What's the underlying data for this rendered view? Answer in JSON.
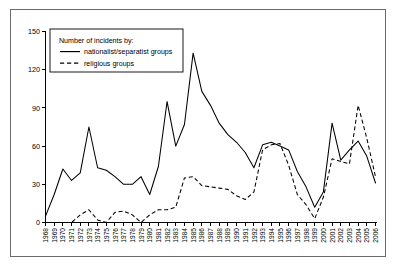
{
  "chart_data": {
    "type": "line",
    "title": "",
    "xlabel": "",
    "ylabel": "",
    "ylim": [
      0,
      150
    ],
    "yticks": [
      0,
      30,
      60,
      90,
      120,
      150
    ],
    "grid": false,
    "legend_position": "top-left",
    "legend_title": "Number of incidents by:",
    "x": [
      1968,
      1969,
      1970,
      1971,
      1972,
      1973,
      1974,
      1975,
      1976,
      1977,
      1978,
      1979,
      1980,
      1981,
      1982,
      1983,
      1984,
      1985,
      1986,
      1987,
      1988,
      1989,
      1990,
      1991,
      1992,
      1993,
      1994,
      1995,
      1996,
      1997,
      1998,
      1999,
      2000,
      2001,
      2002,
      2003,
      2004,
      2005,
      2006
    ],
    "categories": [
      "1968",
      "1969",
      "1970",
      "1971",
      "1972",
      "1973",
      "1974",
      "1975",
      "1976",
      "1977",
      "1978",
      "1979",
      "1980",
      "1981",
      "1982",
      "1983",
      "1984",
      "1985",
      "1986",
      "1987",
      "1988",
      "1989",
      "1990",
      "1991",
      "1992",
      "1993",
      "1994",
      "1995",
      "1996",
      "1997",
      "1998",
      "1999",
      "2000",
      "2001",
      "2002",
      "2003",
      "2004",
      "2005",
      "2006"
    ],
    "series": [
      {
        "name": "nationalist/separatist groups",
        "style": "solid",
        "values": [
          5,
          22,
          42,
          33,
          39,
          75,
          43,
          41,
          36,
          30,
          30,
          36,
          22,
          44,
          95,
          60,
          77,
          133,
          103,
          92,
          78,
          69,
          63,
          55,
          43,
          61,
          63,
          60,
          57,
          40,
          28,
          12,
          24,
          78,
          49,
          57,
          64,
          52,
          31
        ]
      },
      {
        "name": "religious groups",
        "style": "dashed",
        "values": [
          0,
          0,
          0,
          0,
          6,
          10,
          2,
          0,
          8,
          9,
          6,
          0,
          6,
          10,
          10,
          12,
          35,
          36,
          29,
          28,
          27,
          26,
          21,
          18,
          24,
          57,
          61,
          62,
          45,
          22,
          14,
          3,
          20,
          50,
          48,
          46,
          92,
          66,
          36
        ]
      }
    ]
  },
  "legend": {
    "title": "Number of incidents by:",
    "entries": [
      {
        "label": "nationalist/separatist groups",
        "style": "solid"
      },
      {
        "label": "religious groups",
        "style": "dashed"
      }
    ]
  }
}
